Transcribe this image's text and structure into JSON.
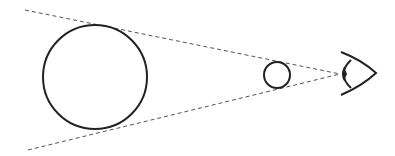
{
  "diagram": {
    "colors": {
      "stroke": "#222222",
      "dashed": "#555555",
      "background": "#ffffff"
    },
    "elements": [
      "large-circle",
      "small-circle",
      "eye-icon",
      "sight-line-top",
      "sight-line-bottom"
    ]
  }
}
